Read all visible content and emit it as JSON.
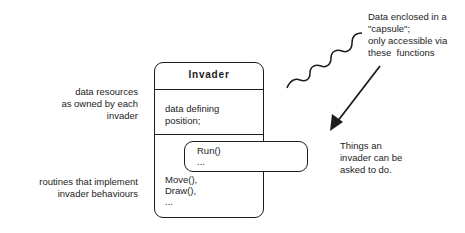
{
  "box": {
    "title": "Invader",
    "data_section": "data defining\nposition;",
    "methods_section": "Move(),\nDraw(),\n...",
    "capsule_text": "Run()\n..."
  },
  "labels": {
    "data_resources": "data resources\nas owned by each\ninvader",
    "routines": "routines that implement\ninvader behaviours",
    "capsule_note": "Data enclosed in a\n\"capsule\";\nonly accessible via\nthese  functions",
    "things_note": "Things an\ninvader can be\nasked to do."
  },
  "colors": {
    "stroke": "#1c1c1c",
    "background": "#ffffff"
  }
}
